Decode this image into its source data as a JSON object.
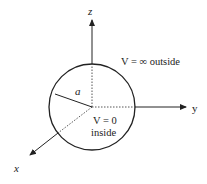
{
  "diagram": {
    "axes": {
      "z_label": "z",
      "y_label": "y",
      "x_label": "x"
    },
    "sphere": {
      "radius_label": "a"
    },
    "labels": {
      "outside": "V = ∞ outside",
      "inside_line1": "V = 0",
      "inside_line2": "inside"
    },
    "colors": {
      "stroke": "#222222",
      "background": "#ffffff"
    }
  }
}
